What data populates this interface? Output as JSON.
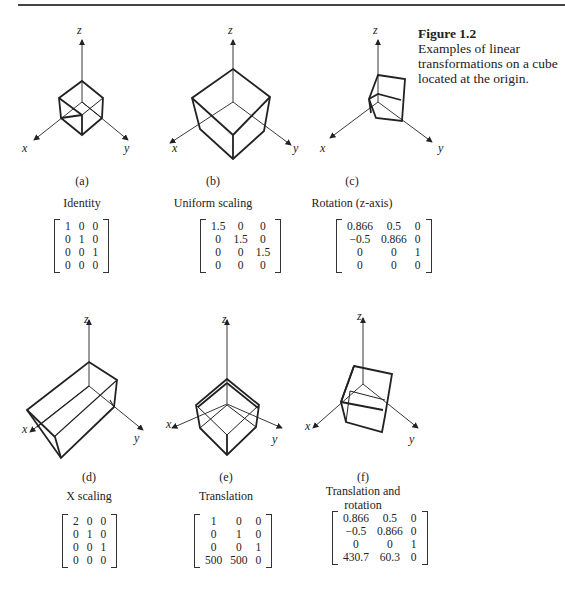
{
  "caption": {
    "figure_label": "Figure 1.2",
    "text": "Examples of linear transformations on a cube located at the origin."
  },
  "axes": {
    "x": "x",
    "y": "y",
    "z": "z"
  },
  "panels": [
    {
      "id": "a",
      "label": "(a)",
      "title": "Identity",
      "matrix": [
        [
          "1",
          "0",
          "0"
        ],
        [
          "0",
          "1",
          "0"
        ],
        [
          "0",
          "0",
          "1"
        ],
        [
          "0",
          "0",
          "0"
        ]
      ]
    },
    {
      "id": "b",
      "label": "(b)",
      "title": "Uniform scaling",
      "matrix": [
        [
          "1.5",
          "0",
          "0"
        ],
        [
          "0",
          "1.5",
          "0"
        ],
        [
          "0",
          "0",
          "1.5"
        ],
        [
          "0",
          "0",
          "0"
        ]
      ]
    },
    {
      "id": "c",
      "label": "(c)",
      "title": "Rotation (z-axis)",
      "matrix": [
        [
          "0.866",
          "0.5",
          "0"
        ],
        [
          "−0.5",
          "0.866",
          "0"
        ],
        [
          "0",
          "0",
          "1"
        ],
        [
          "0",
          "0",
          "0"
        ]
      ]
    },
    {
      "id": "d",
      "label": "(d)",
      "title": "X scaling",
      "matrix": [
        [
          "2",
          "0",
          "0"
        ],
        [
          "0",
          "1",
          "0"
        ],
        [
          "0",
          "0",
          "1"
        ],
        [
          "0",
          "0",
          "0"
        ]
      ]
    },
    {
      "id": "e",
      "label": "(e)",
      "title": "Translation",
      "matrix": [
        [
          "1",
          "0",
          "0"
        ],
        [
          "0",
          "1",
          "0"
        ],
        [
          "0",
          "0",
          "1"
        ],
        [
          "500",
          "500",
          "0"
        ]
      ]
    },
    {
      "id": "f",
      "label": "(f)",
      "title": "Translation and rotation",
      "matrix": [
        [
          "0.866",
          "0.5",
          "0"
        ],
        [
          "−0.5",
          "0.866",
          "0"
        ],
        [
          "0",
          "0",
          "1"
        ],
        [
          "430.7",
          "60.3",
          "0"
        ]
      ]
    }
  ]
}
